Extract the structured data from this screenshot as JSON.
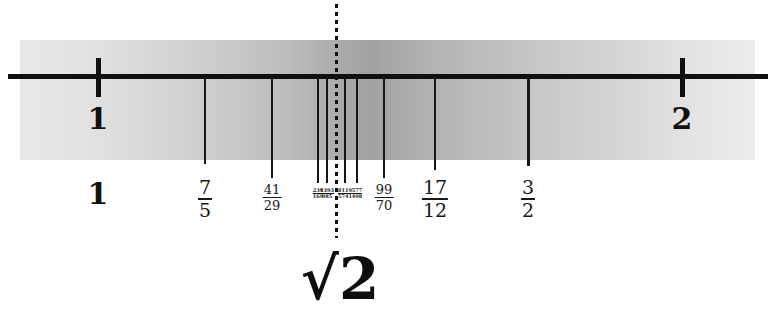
{
  "figure": {
    "caption": "√2",
    "band_color": "#bdbdbd",
    "line_color": "#101010"
  },
  "axis": {
    "left_value": "1",
    "right_value": "2",
    "left_tick_x": 98,
    "right_tick_x": 682,
    "unit_pixels": 584
  },
  "integer_labels": [
    {
      "text": "1",
      "x": 98
    },
    {
      "text": "2",
      "x": 682
    }
  ],
  "lower_label_one": {
    "text": "1",
    "x": 98
  },
  "target": {
    "label": "√2",
    "x": 336,
    "value": "1.41421356"
  },
  "convergents": [
    {
      "numerator": "7",
      "denominator": "5",
      "x": 205,
      "size": "big",
      "value": 1.4
    },
    {
      "numerator": "41",
      "denominator": "29",
      "x": 272,
      "size": "med",
      "value": 1.4137931
    },
    {
      "numerator": "239",
      "denominator": "169",
      "x": 318,
      "size": "tiny",
      "value": 1.4142012
    },
    {
      "numerator": "1393",
      "denominator": "985",
      "x": 327,
      "size": "tiny",
      "value": 1.4142132
    },
    {
      "numerator": "8119",
      "denominator": "5741",
      "x": 345,
      "size": "tiny",
      "value": 1.4142136
    },
    {
      "numerator": "577",
      "denominator": "408",
      "x": 357,
      "size": "tiny",
      "value": 1.4142157
    },
    {
      "numerator": "99",
      "denominator": "70",
      "x": 384,
      "size": "med",
      "value": 1.4142857
    },
    {
      "numerator": "17",
      "denominator": "12",
      "x": 435,
      "size": "big",
      "value": 1.4166667
    },
    {
      "numerator": "3",
      "denominator": "2",
      "x": 528,
      "size": "big",
      "value": 1.5
    }
  ],
  "drop_lines": [
    {
      "x": 205,
      "height": 86,
      "thick": false
    },
    {
      "x": 272,
      "height": 100,
      "thick": false
    },
    {
      "x": 318,
      "height": 105,
      "thick": false
    },
    {
      "x": 327,
      "height": 105,
      "thick": false
    },
    {
      "x": 345,
      "height": 105,
      "thick": false
    },
    {
      "x": 357,
      "height": 105,
      "thick": false
    },
    {
      "x": 384,
      "height": 100,
      "thick": false
    },
    {
      "x": 435,
      "height": 92,
      "thick": false
    },
    {
      "x": 528,
      "height": 88,
      "thick": true
    }
  ]
}
